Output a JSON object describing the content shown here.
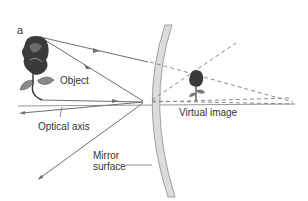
{
  "figure": {
    "panel_label": "a",
    "labels": {
      "object": "Object",
      "optical_axis": "Optical axis",
      "virtual_image": "Virtual image",
      "mirror_surface_line1": "Mirror",
      "mirror_surface_line2": "surface"
    },
    "colors": {
      "ray": "#6e6e6e",
      "dashed_ray": "#8a8a8a",
      "mirror_fill": "#dcdcdc",
      "mirror_stroke": "#8c8c8c",
      "rose_dark": "#3a3a3a",
      "leaf": "#8a8a8a",
      "text": "#333333"
    }
  }
}
